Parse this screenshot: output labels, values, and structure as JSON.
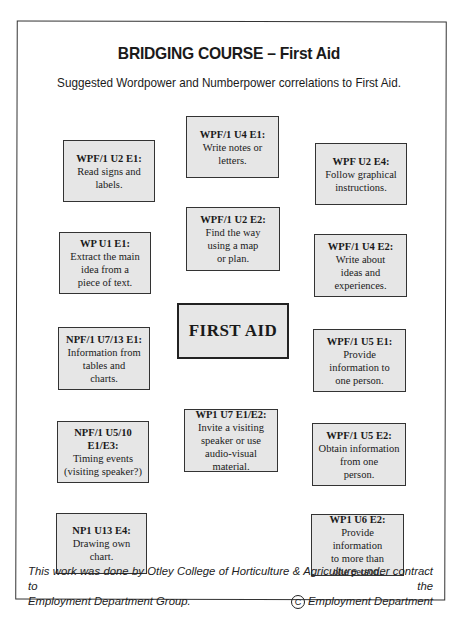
{
  "document": {
    "title": "BRIDGING COURSE – First Aid",
    "subtitle": "Suggested Wordpower and Numberpower correlations to First Aid.",
    "center_label": "FIRST AID",
    "boxes": [
      {
        "code": "WPF/1 U2 E1:",
        "desc": "Read signs and\nlabels."
      },
      {
        "code": "WPF/1 U4 E1:",
        "desc": "Write notes or\nletters."
      },
      {
        "code": "WPF U2 E4:",
        "desc": "Follow graphical\ninstructions."
      },
      {
        "code": "WPF/1 U2 E2:",
        "desc": "Find the way\nusing a map\nor plan."
      },
      {
        "code": "WP U1 E1:",
        "desc": "Extract the main\nidea from a\npiece of text."
      },
      {
        "code": "WPF/1 U4 E2:",
        "desc": "Write about\nideas and\nexperiences."
      },
      {
        "code": "NPF/1 U7/13 E1:",
        "desc": "Information from\ntables and\ncharts."
      },
      {
        "code": "WPF/1 U5 E1:",
        "desc": "Provide\ninformation to\none person."
      },
      {
        "code": "NPF/1 U5/10 E1/E3:",
        "desc": "Timing events\n(visiting speaker?)"
      },
      {
        "code": "WP1 U7 E1/E2:",
        "desc": "Invite a visiting\nspeaker or use\naudio-visual material."
      },
      {
        "code": "WPF/1 U5 E2:",
        "desc": "Obtain information\nfrom one\nperson."
      },
      {
        "code": "NP1 U13 E4:",
        "desc": "Drawing own\nchart."
      },
      {
        "code": "WP1 U6 E2:",
        "desc": "Provide information\nto more than\none person."
      }
    ],
    "footer": {
      "line1": "This work was done by Otley College of Horticulture & Agriculture under contract to the",
      "line2_left": "Employment Department Group.",
      "copyright_symbol": "C",
      "line2_right": "Employment Department"
    }
  }
}
